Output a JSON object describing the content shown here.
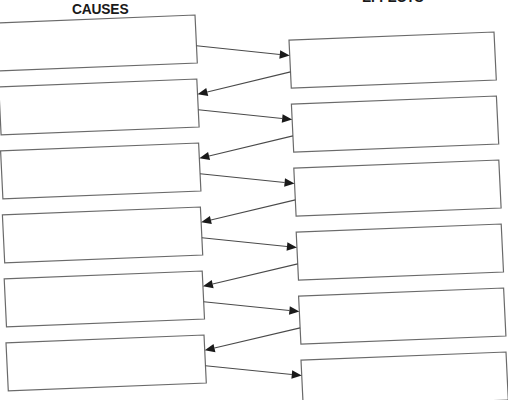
{
  "worksheet": {
    "type": "cause-and-effect organizer",
    "headings": {
      "left": "CAUSES",
      "right": "EFFECTS"
    },
    "colors": {
      "box_border": "#6a6a6a",
      "arrow": "#1a1a1a",
      "background": "#ffffff"
    },
    "causes": [
      {
        "text": ""
      },
      {
        "text": ""
      },
      {
        "text": ""
      },
      {
        "text": ""
      },
      {
        "text": ""
      },
      {
        "text": ""
      }
    ],
    "effects": [
      {
        "text": ""
      },
      {
        "text": ""
      },
      {
        "text": ""
      },
      {
        "text": ""
      },
      {
        "text": ""
      },
      {
        "text": ""
      }
    ],
    "connections": [
      {
        "from": "cause-1",
        "to": "effect-1"
      },
      {
        "from": "effect-1",
        "to": "cause-2"
      },
      {
        "from": "cause-2",
        "to": "effect-2"
      },
      {
        "from": "effect-2",
        "to": "cause-3"
      },
      {
        "from": "cause-3",
        "to": "effect-3"
      },
      {
        "from": "effect-3",
        "to": "cause-4"
      },
      {
        "from": "cause-4",
        "to": "effect-4"
      },
      {
        "from": "effect-4",
        "to": "cause-5"
      },
      {
        "from": "cause-5",
        "to": "effect-5"
      },
      {
        "from": "effect-5",
        "to": "cause-6"
      },
      {
        "from": "cause-6",
        "to": "effect-6"
      }
    ]
  }
}
